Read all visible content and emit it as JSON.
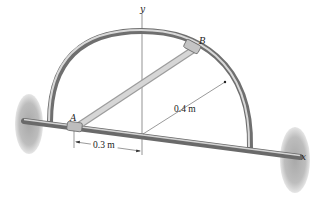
{
  "figure": {
    "type": "engineering-mechanics diagram",
    "labels": {
      "y_axis": "y",
      "x_axis": "x",
      "point_a": "A",
      "point_b": "B",
      "radius": "0.4 m",
      "offset": "0.3 m"
    },
    "colors": {
      "rod": "#8a8a8a",
      "rod_highlight": "#d8d8d8",
      "link": "#c9c9c9",
      "wall": "#b5b5b5",
      "lines": "#555555"
    }
  }
}
